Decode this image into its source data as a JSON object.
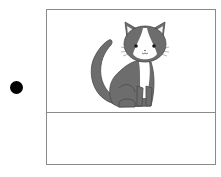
{
  "item": {
    "bullet": "bullet-point",
    "image": {
      "subject": "cat-illustration",
      "description": "gray and white cat sitting",
      "colors": {
        "fur": "#6d6d6d",
        "outline": "#4a4a4a",
        "white": "#ffffff",
        "inner_ear": "#f2f2f2"
      }
    },
    "answer_box": {
      "value": ""
    }
  },
  "colors": {
    "border": "#8a8a8a",
    "bullet": "#000000",
    "background": "#ffffff"
  }
}
